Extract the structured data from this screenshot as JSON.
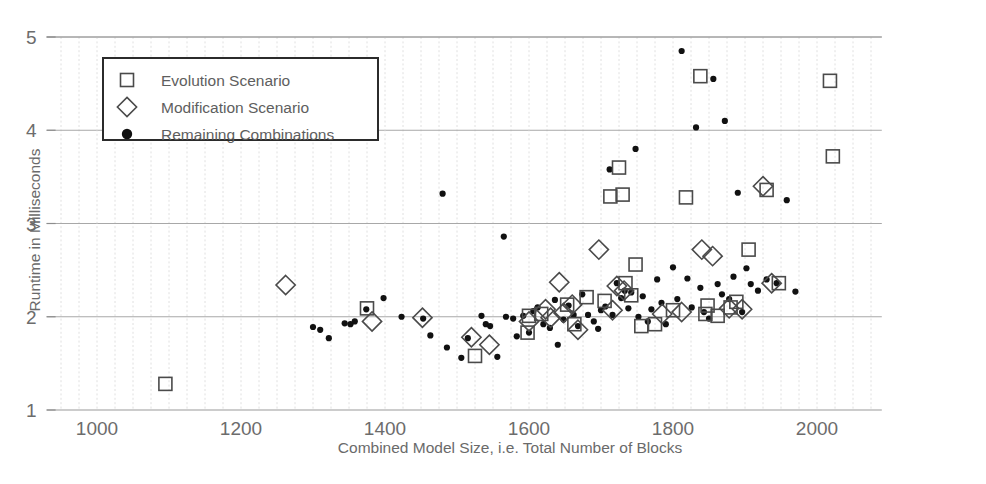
{
  "chart_data": {
    "type": "scatter",
    "title": "",
    "xlabel": "Combined Model Size, i.e. Total Number of Blocks",
    "ylabel": "Runtime in Milliseconds",
    "xlim": [
      930,
      2090
    ],
    "ylim": [
      1,
      5
    ],
    "xticks": [
      1000,
      1200,
      1400,
      1600,
      1800,
      2000
    ],
    "yticks": [
      1,
      2,
      3,
      4,
      5
    ],
    "xtick_labels": [
      "1000",
      "1200",
      "1400",
      "1600",
      "1800",
      "2000"
    ],
    "ytick_labels": [
      "1",
      "2",
      "3",
      "4",
      "5"
    ],
    "x_minor_step": 25,
    "y_minor_step": 1,
    "grid": true,
    "legend_position": "upper-left",
    "legend": [
      {
        "label": "Evolution Scenario",
        "marker": "square-open"
      },
      {
        "label": "Modification Scenario",
        "marker": "diamond-open"
      },
      {
        "label": "Remaining Combinations",
        "marker": "circle-filled"
      }
    ],
    "series": [
      {
        "name": "Evolution Scenario",
        "marker": "square-open",
        "points": [
          [
            1095,
            1.28
          ],
          [
            1375,
            2.09
          ],
          [
            1525,
            1.58
          ],
          [
            1598,
            1.83
          ],
          [
            1600,
            2.01
          ],
          [
            1617,
            2.03
          ],
          [
            1653,
            2.13
          ],
          [
            1663,
            1.92
          ],
          [
            1680,
            2.21
          ],
          [
            1705,
            2.17
          ],
          [
            1713,
            3.29
          ],
          [
            1725,
            3.6
          ],
          [
            1730,
            3.31
          ],
          [
            1734,
            2.36
          ],
          [
            1742,
            2.23
          ],
          [
            1748,
            2.56
          ],
          [
            1756,
            1.9
          ],
          [
            1775,
            1.92
          ],
          [
            1800,
            2.07
          ],
          [
            1818,
            3.28
          ],
          [
            1838,
            4.58
          ],
          [
            1845,
            2.03
          ],
          [
            1848,
            2.12
          ],
          [
            1862,
            2.01
          ],
          [
            1880,
            2.1
          ],
          [
            1888,
            2.16
          ],
          [
            1905,
            2.72
          ],
          [
            1930,
            3.36
          ],
          [
            1947,
            2.36
          ],
          [
            2018,
            4.53
          ],
          [
            2022,
            3.72
          ]
        ]
      },
      {
        "name": "Modification Scenario",
        "marker": "diamond-open",
        "points": [
          [
            1262,
            2.34
          ],
          [
            1382,
            1.95
          ],
          [
            1452,
            1.99
          ],
          [
            1520,
            1.78
          ],
          [
            1545,
            1.7
          ],
          [
            1600,
            1.95
          ],
          [
            1623,
            2.08
          ],
          [
            1630,
            1.99
          ],
          [
            1642,
            2.37
          ],
          [
            1648,
            2.04
          ],
          [
            1660,
            2.13
          ],
          [
            1668,
            1.86
          ],
          [
            1697,
            2.72
          ],
          [
            1716,
            2.07
          ],
          [
            1722,
            2.33
          ],
          [
            1732,
            2.28
          ],
          [
            1785,
            2.03
          ],
          [
            1812,
            2.05
          ],
          [
            1840,
            2.72
          ],
          [
            1855,
            2.65
          ],
          [
            1878,
            2.09
          ],
          [
            1896,
            2.08
          ],
          [
            1925,
            3.4
          ],
          [
            1937,
            2.36
          ]
        ]
      },
      {
        "name": "Remaining Combinations",
        "marker": "circle-filled",
        "points": [
          [
            1300,
            1.89
          ],
          [
            1310,
            1.86
          ],
          [
            1322,
            1.77
          ],
          [
            1344,
            1.93
          ],
          [
            1352,
            1.92
          ],
          [
            1358,
            1.95
          ],
          [
            1374,
            2.08
          ],
          [
            1398,
            2.2
          ],
          [
            1423,
            2.0
          ],
          [
            1453,
            1.98
          ],
          [
            1463,
            1.8
          ],
          [
            1480,
            3.32
          ],
          [
            1486,
            1.67
          ],
          [
            1506,
            1.56
          ],
          [
            1515,
            1.77
          ],
          [
            1534,
            2.01
          ],
          [
            1540,
            1.92
          ],
          [
            1546,
            1.9
          ],
          [
            1556,
            1.57
          ],
          [
            1565,
            2.86
          ],
          [
            1568,
            2.0
          ],
          [
            1578,
            1.98
          ],
          [
            1583,
            1.79
          ],
          [
            1592,
            2.01
          ],
          [
            1600,
            1.83
          ],
          [
            1606,
            2.06
          ],
          [
            1612,
            2.1
          ],
          [
            1620,
            1.92
          ],
          [
            1629,
            1.88
          ],
          [
            1636,
            2.18
          ],
          [
            1640,
            1.7
          ],
          [
            1648,
            1.97
          ],
          [
            1655,
            2.12
          ],
          [
            1662,
            2.02
          ],
          [
            1668,
            1.9
          ],
          [
            1674,
            2.24
          ],
          [
            1682,
            2.02
          ],
          [
            1690,
            1.95
          ],
          [
            1696,
            1.87
          ],
          [
            1700,
            2.07
          ],
          [
            1706,
            2.11
          ],
          [
            1712,
            3.58
          ],
          [
            1716,
            2.02
          ],
          [
            1722,
            2.36
          ],
          [
            1728,
            2.2
          ],
          [
            1733,
            2.28
          ],
          [
            1738,
            2.09
          ],
          [
            1742,
            2.26
          ],
          [
            1748,
            3.8
          ],
          [
            1752,
            2.0
          ],
          [
            1758,
            2.22
          ],
          [
            1765,
            1.95
          ],
          [
            1770,
            2.08
          ],
          [
            1778,
            2.4
          ],
          [
            1784,
            2.15
          ],
          [
            1790,
            1.92
          ],
          [
            1800,
            2.53
          ],
          [
            1806,
            2.19
          ],
          [
            1812,
            4.85
          ],
          [
            1820,
            2.41
          ],
          [
            1826,
            2.1
          ],
          [
            1832,
            4.03
          ],
          [
            1838,
            2.31
          ],
          [
            1843,
            2.05
          ],
          [
            1850,
            1.98
          ],
          [
            1856,
            4.55
          ],
          [
            1862,
            2.35
          ],
          [
            1868,
            2.24
          ],
          [
            1872,
            4.1
          ],
          [
            1878,
            2.19
          ],
          [
            1884,
            2.43
          ],
          [
            1890,
            3.33
          ],
          [
            1896,
            2.05
          ],
          [
            1902,
            2.52
          ],
          [
            1908,
            2.35
          ],
          [
            1918,
            2.28
          ],
          [
            1930,
            2.4
          ],
          [
            1944,
            2.36
          ],
          [
            1958,
            3.25
          ],
          [
            1970,
            2.27
          ]
        ]
      }
    ]
  },
  "axes": {
    "x_title": "Combined Model Size, i.e. Total Number of Blocks",
    "y_title": "Runtime in Milliseconds"
  }
}
